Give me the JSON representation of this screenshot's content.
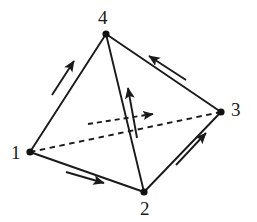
{
  "figure": {
    "type": "directed-graph-tetrahedron",
    "background_color": "#ffffff",
    "stroke_color": "#1a1a1a",
    "vertex_fill_color": "#111111"
  },
  "vertices": [
    {
      "id": "v1",
      "label": "1",
      "x": 30,
      "y": 152,
      "label_x": 11,
      "label_y": 143,
      "dot_r": 3.6
    },
    {
      "id": "v2",
      "label": "2",
      "x": 144,
      "y": 192,
      "label_x": 140,
      "label_y": 199,
      "dot_r": 3.6
    },
    {
      "id": "v3",
      "label": "3",
      "x": 221,
      "y": 112,
      "label_x": 231,
      "label_y": 100,
      "dot_r": 3.6
    },
    {
      "id": "v4",
      "label": "4",
      "x": 106,
      "y": 34,
      "label_x": 98,
      "label_y": 8,
      "dot_r": 3.6
    }
  ],
  "edges": [
    {
      "id": "e-1-4",
      "from": "1",
      "to": "4",
      "style": "solid",
      "direction": "1->4"
    },
    {
      "id": "e-1-2",
      "from": "1",
      "to": "2",
      "style": "solid",
      "direction": "1->2"
    },
    {
      "id": "e-1-3",
      "from": "1",
      "to": "3",
      "style": "dashed",
      "direction": "1->3"
    },
    {
      "id": "e-2-4",
      "from": "2",
      "to": "4",
      "style": "solid",
      "direction": "2->4"
    },
    {
      "id": "e-2-3",
      "from": "2",
      "to": "3",
      "style": "solid",
      "direction": "2->3"
    },
    {
      "id": "e-3-4",
      "from": "3",
      "to": "4",
      "style": "solid",
      "direction": "3->4"
    }
  ],
  "orientation_arrows": [
    {
      "id": "a-1-4",
      "for_edge": "e-1-4",
      "style": "solid",
      "x1": 52,
      "y1": 95,
      "x2": 74,
      "y2": 61
    },
    {
      "id": "a-1-2",
      "for_edge": "e-1-2",
      "style": "solid",
      "x1": 66,
      "y1": 172,
      "x2": 104,
      "y2": 183
    },
    {
      "id": "a-1-3",
      "for_edge": "e-1-3",
      "style": "dashed",
      "x1": 88,
      "y1": 124,
      "x2": 153,
      "y2": 114
    },
    {
      "id": "a-2-4",
      "for_edge": "e-2-4",
      "style": "solid",
      "x1": 137,
      "y1": 138,
      "x2": 128,
      "y2": 88
    },
    {
      "id": "a-2-3",
      "for_edge": "e-2-3",
      "style": "solid",
      "x1": 176,
      "y1": 165,
      "x2": 206,
      "y2": 133
    },
    {
      "id": "a-3-4",
      "for_edge": "e-3-4",
      "style": "solid",
      "x1": 186,
      "y1": 80,
      "x2": 149,
      "y2": 56
    }
  ]
}
